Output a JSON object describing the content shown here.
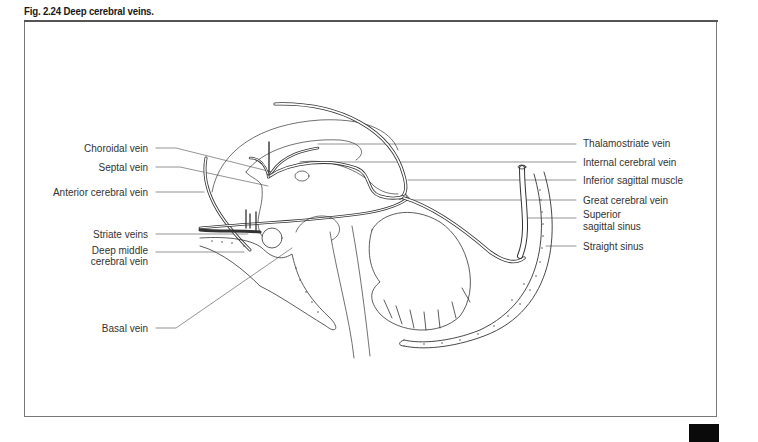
{
  "figure": {
    "title": "Fig. 2.24  Deep cerebral veins."
  },
  "labels_left": [
    {
      "id": "choroidal-vein",
      "text": "Choroidal vein",
      "x_right": 148,
      "y": 148
    },
    {
      "id": "septal-vein",
      "text": "Septal vein",
      "x_right": 148,
      "y": 167
    },
    {
      "id": "anterior-cerebral-vein",
      "text": "Anterior cerebral vein",
      "x_right": 148,
      "y": 192
    },
    {
      "id": "striate-veins",
      "text": "Striate veins",
      "x_right": 148,
      "y": 234
    },
    {
      "id": "deep-middle-cerebral-vein-1",
      "text": "Deep middle",
      "x_right": 148,
      "y": 250
    },
    {
      "id": "deep-middle-cerebral-vein-2",
      "text": "cerebral vein",
      "x_right": 148,
      "y": 261
    },
    {
      "id": "basal-vein",
      "text": "Basal vein",
      "x_right": 148,
      "y": 328
    }
  ],
  "labels_right": [
    {
      "id": "thalamostriate-vein",
      "text": "Thalamostriate vein",
      "x": 583,
      "y": 143
    },
    {
      "id": "internal-cerebral-vein",
      "text": "Internal cerebral vein",
      "x": 583,
      "y": 162
    },
    {
      "id": "inferior-sagittal-muscle",
      "text": "Inferior sagittal muscle",
      "x": 583,
      "y": 180
    },
    {
      "id": "great-cerebral-vein",
      "text": "Great cerebral vein",
      "x": 583,
      "y": 200
    },
    {
      "id": "superior-sagittal-sinus-1",
      "text": "Superior",
      "x": 583,
      "y": 214
    },
    {
      "id": "superior-sagittal-sinus-2",
      "text": "sagittal sinus",
      "x": 583,
      "y": 226
    },
    {
      "id": "straight-sinus",
      "text": "Straight sinus",
      "x": 583,
      "y": 246
    }
  ],
  "colors": {
    "ink": "#333333",
    "frame": "#777777",
    "vessel_fill": "#ffffff",
    "corner_tab": "#0a0a0a"
  }
}
